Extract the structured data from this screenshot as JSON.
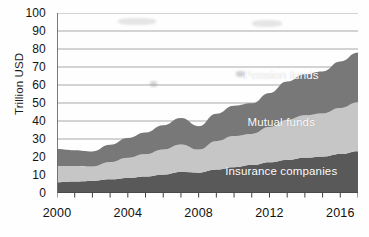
{
  "chart_data": {
    "type": "area",
    "stacked": true,
    "title": "",
    "subtitle": "",
    "xlabel": "",
    "ylabel": "Trillion USD",
    "xlim": [
      2000,
      2017
    ],
    "ylim": [
      0,
      100
    ],
    "y_ticks": [
      0,
      10,
      20,
      30,
      40,
      50,
      60,
      70,
      80,
      90,
      100
    ],
    "y_tick_labels": [
      "0",
      "10",
      "20",
      "30",
      "40",
      "50",
      "60",
      "70",
      "80",
      "90",
      "100"
    ],
    "x_ticks": [
      2000,
      2001,
      2002,
      2003,
      2004,
      2005,
      2006,
      2007,
      2008,
      2009,
      2010,
      2011,
      2012,
      2013,
      2014,
      2015,
      2016,
      2017
    ],
    "x_tick_labels": [
      "2000",
      "",
      "",
      "",
      "2004",
      "",
      "",
      "",
      "2008",
      "",
      "",
      "",
      "2012",
      "",
      "",
      "",
      "2016",
      ""
    ],
    "x_labeled_ticks": [
      {
        "value": 2000,
        "label": "2000"
      },
      {
        "value": 2004,
        "label": "2004"
      },
      {
        "value": 2008,
        "label": "2008"
      },
      {
        "value": 2012,
        "label": "2012"
      },
      {
        "value": 2016,
        "label": "2016"
      }
    ],
    "grid": true,
    "grid_axis": "y",
    "legend": "inline-labels",
    "x": [
      2000,
      2001,
      2002,
      2003,
      2004,
      2005,
      2006,
      2007,
      2008,
      2009,
      2010,
      2011,
      2012,
      2013,
      2014,
      2015,
      2016,
      2017
    ],
    "series": [
      {
        "name": "Insurance companies",
        "color": "#595959",
        "label_color": "#ffffff",
        "values": [
          6.0,
          6.4,
          6.7,
          7.6,
          8.4,
          9.2,
          10.2,
          11.6,
          11.3,
          13.0,
          14.3,
          15.5,
          17.1,
          18.4,
          19.6,
          20.2,
          21.6,
          23.2
        ]
      },
      {
        "name": "Mutual funds",
        "color": "#c6c6c6",
        "label_color": "#ffffff",
        "values": [
          9.0,
          8.6,
          8.0,
          9.6,
          11.2,
          12.4,
          14.0,
          15.4,
          12.8,
          15.8,
          17.3,
          17.3,
          19.5,
          22.3,
          23.6,
          24.0,
          25.6,
          27.2
        ]
      },
      {
        "name": "Pension funds",
        "color": "#787878",
        "label_color": "#ffffff",
        "values": [
          9.5,
          8.8,
          8.4,
          9.6,
          11.0,
          12.0,
          13.4,
          14.6,
          13.0,
          15.2,
          16.9,
          17.0,
          19.0,
          21.3,
          22.8,
          23.3,
          25.8,
          27.6
        ]
      }
    ],
    "totals": [
      24.5,
      23.8,
      23.1,
      26.8,
      30.6,
      33.6,
      37.6,
      41.6,
      37.1,
      44.0,
      48.5,
      49.8,
      55.6,
      62.0,
      66.0,
      67.5,
      73.0,
      78.0
    ],
    "series_labels": [
      {
        "name": "Pension funds",
        "text": "Pension funds",
        "x_frac": 0.745,
        "y_frac": 0.345
      },
      {
        "name": "Mutual funds",
        "text": "Mutual funds",
        "x_frac": 0.745,
        "y_frac": 0.605
      },
      {
        "name": "Insurance companies",
        "text": "Insurance companies",
        "x_frac": 0.745,
        "y_frac": 0.875
      }
    ]
  },
  "axes": {
    "y_title": "Trillion USD",
    "axis_color": "#5f5f5f",
    "grid_color": "#9a9a9a",
    "tick_color": "#3a3a3a"
  },
  "colors": {
    "background": "#fefefe",
    "insurance": "#595959",
    "mutual": "#c6c6c6",
    "pension": "#787878",
    "text": "#111111"
  }
}
